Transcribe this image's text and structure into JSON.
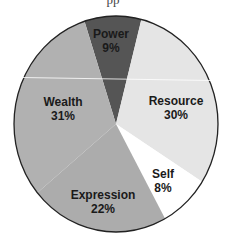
{
  "header": {
    "cut_off_text": "pp"
  },
  "chart_data": {
    "type": "pie",
    "title": "",
    "start_angle_deg": -18,
    "direction": "clockwise",
    "center": [
      116,
      124
    ],
    "radius": [
      102,
      108
    ],
    "slices": [
      {
        "label": "Power",
        "value": 9,
        "display": "9%",
        "color": "#555555"
      },
      {
        "label": "Resource",
        "value": 30,
        "display": "30%",
        "color": "#e5e5e5"
      },
      {
        "label": "Self",
        "value": 8,
        "display": "8%",
        "color": "#ffffff"
      },
      {
        "label": "Expression",
        "value": 22,
        "display": "22%",
        "color": "#acacac"
      },
      {
        "label": "Wealth",
        "value": 31,
        "display": "31%",
        "color": "#b1b1b1"
      }
    ],
    "categories": [
      "Power",
      "Resource",
      "Self",
      "Expression",
      "Wealth"
    ],
    "values": [
      9,
      30,
      8,
      22,
      31
    ],
    "legend": "none (labels inside slices)",
    "outline_color": "#222222"
  },
  "labels": {
    "power": {
      "name": "Power",
      "pct": "9%"
    },
    "resource": {
      "name": "Resource",
      "pct": "30%"
    },
    "self": {
      "name": "Self",
      "pct": "8%"
    },
    "expression": {
      "name": "Expression",
      "pct": "22%"
    },
    "wealth": {
      "name": "Wealth",
      "pct": "31%"
    }
  }
}
